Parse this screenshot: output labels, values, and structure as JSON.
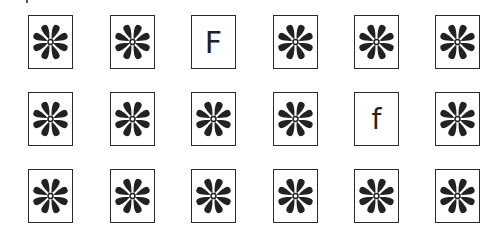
{
  "figure": {
    "rows": 3,
    "columns": 6,
    "colors": {
      "ink": "#222222",
      "background": "#ffffff"
    },
    "cells": [
      [
        {
          "type": "flower-symbol",
          "label": ""
        },
        {
          "type": "flower-symbol",
          "label": ""
        },
        {
          "type": "letter",
          "label": "F"
        },
        {
          "type": "flower-symbol",
          "label": ""
        },
        {
          "type": "flower-symbol",
          "label": ""
        },
        {
          "type": "flower-symbol",
          "label": ""
        }
      ],
      [
        {
          "type": "flower-symbol",
          "label": ""
        },
        {
          "type": "flower-symbol",
          "label": ""
        },
        {
          "type": "flower-symbol",
          "label": ""
        },
        {
          "type": "flower-symbol",
          "label": ""
        },
        {
          "type": "letter",
          "label": "f"
        },
        {
          "type": "flower-symbol",
          "label": ""
        }
      ],
      [
        {
          "type": "flower-symbol",
          "label": ""
        },
        {
          "type": "flower-symbol",
          "label": ""
        },
        {
          "type": "flower-symbol",
          "label": ""
        },
        {
          "type": "flower-symbol",
          "label": ""
        },
        {
          "type": "flower-symbol",
          "label": ""
        },
        {
          "type": "flower-symbol",
          "label": ""
        }
      ]
    ]
  }
}
